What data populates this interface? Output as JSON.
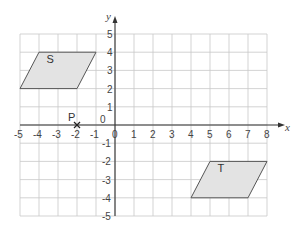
{
  "diagram": {
    "type": "coordinate-grid",
    "axes": {
      "x_label": "x",
      "y_label": "y",
      "x_range": [
        -5,
        8
      ],
      "y_range": [
        -5,
        5
      ],
      "x_ticks": [
        "-5",
        "-4",
        "-3",
        "-2",
        "-1",
        "0",
        "1",
        "2",
        "3",
        "4",
        "5",
        "6",
        "7",
        "8"
      ],
      "y_ticks": [
        "5",
        "4",
        "3",
        "2",
        "1",
        "0",
        "-1",
        "-2",
        "-3",
        "-4",
        "-5"
      ],
      "origin_label": "0"
    },
    "shapes": [
      {
        "label": "S",
        "vertices": [
          [
            -5,
            2
          ],
          [
            -4,
            4
          ],
          [
            -1,
            4
          ],
          [
            -2,
            2
          ]
        ],
        "fill": "#e3e3e3"
      },
      {
        "label": "T",
        "vertices": [
          [
            4,
            -4
          ],
          [
            5,
            -2
          ],
          [
            8,
            -2
          ],
          [
            7,
            -4
          ]
        ],
        "fill": "#e3e3e3"
      }
    ],
    "points": [
      {
        "label": "P",
        "x": -2,
        "y": 0,
        "marker": "cross"
      }
    ]
  }
}
